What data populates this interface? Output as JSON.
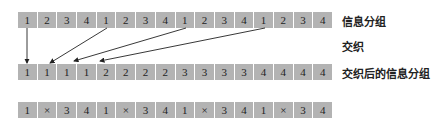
{
  "rows": {
    "info_groups": [
      "1",
      "2",
      "3",
      "4",
      "1",
      "2",
      "3",
      "4",
      "1",
      "2",
      "3",
      "4",
      "1",
      "2",
      "3",
      "4"
    ],
    "interleaved": [
      "1",
      "1",
      "1",
      "1",
      "2",
      "2",
      "2",
      "2",
      "3",
      "3",
      "3",
      "3",
      "4",
      "4",
      "4",
      "4"
    ],
    "received": [
      "1",
      "×",
      "3",
      "4",
      "1",
      "×",
      "3",
      "4",
      "1",
      "×",
      "3",
      "4",
      "1",
      "×",
      "3",
      "4"
    ]
  },
  "labels": {
    "info_groups": "信息分组",
    "interleave": "交织",
    "interleaved_groups": "交织后的信息分组"
  },
  "arrows": [
    {
      "from_cell": 1,
      "to_cell": 1
    },
    {
      "from_cell": 5,
      "to_cell": 2
    },
    {
      "from_cell": 9,
      "to_cell": 3
    },
    {
      "from_cell": 13,
      "to_cell": 4
    }
  ],
  "colors": {
    "cell_fill": "#b3b3b3",
    "text": "#222222",
    "arrow": "#222222"
  }
}
